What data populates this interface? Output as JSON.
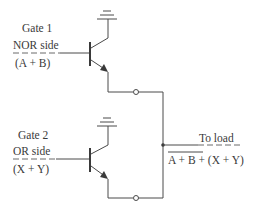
{
  "diagram": {
    "gate1": {
      "name": "Gate 1",
      "side": "NOR side",
      "expr_open": "(",
      "expr_a": "A",
      "expr_plus": " + ",
      "expr_b": "B",
      "expr_close": ")"
    },
    "gate2": {
      "name": "Gate 2",
      "side": "OR side",
      "expr_open": "(",
      "expr_x": "X",
      "expr_plus": " + ",
      "expr_y": "Y",
      "expr_close": ")"
    },
    "output": {
      "label": "To load",
      "expr_a": "A",
      "expr_plus1": " + ",
      "expr_b": "B",
      "expr_rest_plus": " + (",
      "expr_x": "X",
      "expr_plus2": " + ",
      "expr_y": "Y",
      "expr_close": ")"
    },
    "colors": {
      "ink": "#3a3a3a",
      "background": "#ffffff"
    }
  }
}
